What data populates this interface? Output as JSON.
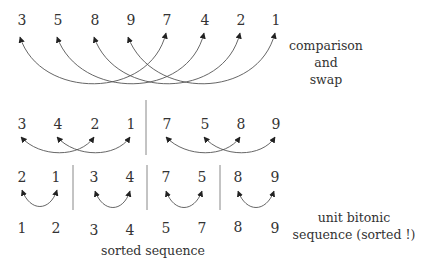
{
  "rows": [
    {
      "name": "input",
      "values": [
        "3",
        "5",
        "8",
        "9",
        "7",
        "4",
        "2",
        "1"
      ]
    },
    {
      "name": "after-first-merge",
      "values": [
        "3",
        "4",
        "2",
        "1",
        "7",
        "5",
        "8",
        "9"
      ]
    },
    {
      "name": "after-second-merge",
      "values": [
        "2",
        "1",
        "3",
        "4",
        "7",
        "5",
        "8",
        "9"
      ]
    },
    {
      "name": "sorted",
      "values": [
        "1",
        "2",
        "3",
        "4",
        "5",
        "7",
        "8",
        "9"
      ]
    }
  ],
  "labels": {
    "comparison_line1": "comparison",
    "comparison_line2": "and",
    "comparison_line3": "swap",
    "unit_line1": "unit bitonic",
    "unit_line2": "sequence (sorted !)",
    "sorted_sequence": "sorted sequence"
  },
  "colors": {
    "text": "#333333",
    "arrow": "#555555",
    "separator": "#888888",
    "background": "#ffffff"
  }
}
